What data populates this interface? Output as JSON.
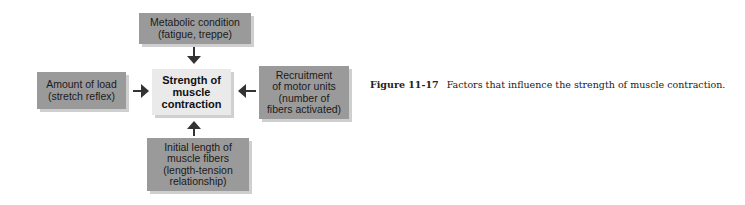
{
  "diagram": {
    "center": {
      "lines": [
        "Strength of",
        "muscle",
        "contraction"
      ]
    },
    "factors": {
      "top": {
        "lines": [
          "Metabolic condition",
          "(fatigue, treppe)"
        ]
      },
      "left": {
        "lines": [
          "Amount of load",
          "(stretch reflex)"
        ]
      },
      "right": {
        "lines": [
          "Recruitment",
          "of motor units",
          "(number of",
          "fibers activated)"
        ]
      },
      "bottom": {
        "lines": [
          "Initial length of",
          "muscle fibers",
          "(length-tension",
          "relationship)"
        ]
      }
    },
    "colors": {
      "factor_box": "#9a9a9a",
      "center_box": "#eaeaea",
      "arrow": "#333333"
    }
  },
  "caption": {
    "label": "Figure 11-17",
    "text": "Factors that influence the strength of muscle contraction."
  }
}
